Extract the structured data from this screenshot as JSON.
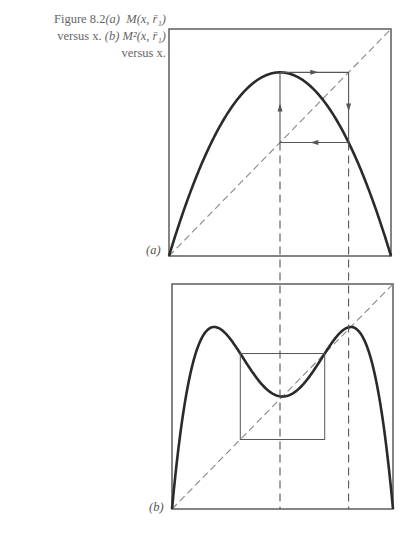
{
  "caption": {
    "figure_label": "Figure 8.2",
    "part_a_label": "(a)",
    "part_a_text": "M(x, r̄₁)",
    "versus_1": "versus x.",
    "part_b_label": "(b)",
    "part_b_text": "M²(x, r̄₁)",
    "versus_2": "versus x."
  },
  "panels": {
    "a": {
      "label": "(a)"
    },
    "b": {
      "label": "(b)"
    }
  },
  "colors": {
    "curve": "#2a2a2a",
    "frame": "#666666",
    "guide": "#555555",
    "diagonal": "#888888"
  },
  "chart_data": [
    {
      "type": "line",
      "title": "M(x, r̄₁) versus x",
      "panel": "(a)",
      "xlabel": "x",
      "ylabel": "M(x, r̄₁)",
      "xlim": [
        0,
        1
      ],
      "ylim": [
        0,
        1
      ],
      "grid": false,
      "function": "r*x*(1-x)",
      "r": 3.236,
      "series": [
        {
          "name": "M(x, r̄₁)",
          "style": "solid-thick"
        },
        {
          "name": "diagonal y=x",
          "style": "dashed"
        }
      ],
      "annotations": {
        "cobweb_2_cycle": [
          {
            "from": [
              0.5,
              0.5
            ],
            "to": [
              0.5,
              0.809
            ],
            "arrow": "up"
          },
          {
            "from": [
              0.5,
              0.809
            ],
            "to": [
              0.809,
              0.809
            ],
            "arrow": "right"
          },
          {
            "from": [
              0.809,
              0.809
            ],
            "to": [
              0.809,
              0.5
            ],
            "arrow": "down"
          },
          {
            "from": [
              0.809,
              0.5
            ],
            "to": [
              0.5,
              0.5
            ],
            "arrow": "left"
          }
        ],
        "cycle_points_x": [
          0.5,
          0.809
        ]
      }
    },
    {
      "type": "line",
      "title": "M²(x, r̄₁) versus x",
      "panel": "(b)",
      "xlabel": "x",
      "ylabel": "M²(x, r̄₁)",
      "xlim": [
        0,
        1
      ],
      "ylim": [
        0,
        1
      ],
      "grid": false,
      "function": "M(M(x))",
      "r": 3.236,
      "series": [
        {
          "name": "M²(x, r̄₁)",
          "style": "solid-thick"
        },
        {
          "name": "diagonal y=x",
          "style": "dashed"
        }
      ],
      "annotations": {
        "fixed_points_x": [
          0.5,
          0.809
        ],
        "inner_square": {
          "x": [
            0.309,
            0.691
          ],
          "y": [
            0.309,
            0.691
          ]
        },
        "local_min": [
          0.5,
          0.5
        ],
        "peaks_x": [
          0.191,
          0.809
        ],
        "peak_value": 0.809
      }
    }
  ],
  "connectors": {
    "vertical_dashed_x": [
      0.5,
      0.809
    ]
  }
}
